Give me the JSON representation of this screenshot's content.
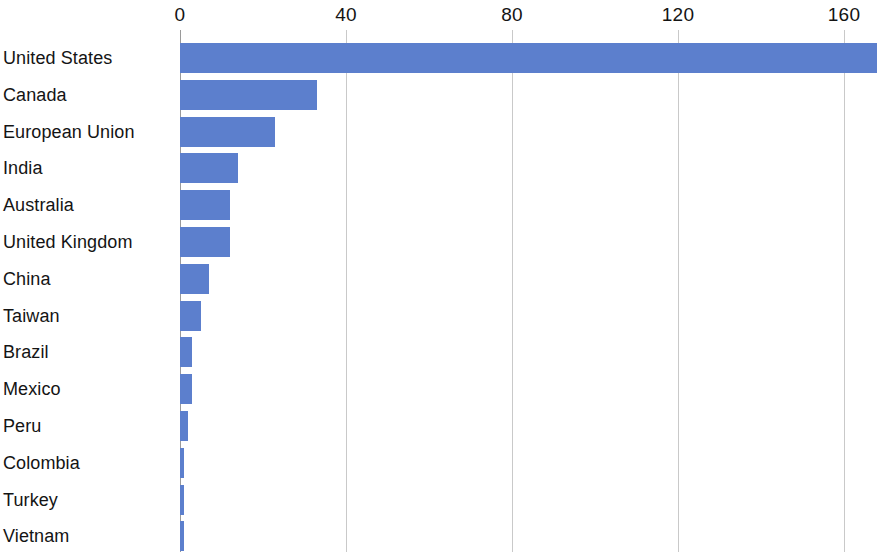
{
  "chart_data": {
    "type": "bar",
    "orientation": "horizontal",
    "title": "",
    "subtitle": "",
    "xlabel": "",
    "ylabel": "",
    "categories": [
      "United States",
      "Canada",
      "European Union",
      "India",
      "Australia",
      "United Kingdom",
      "China",
      "Taiwan",
      "Brazil",
      "Mexico",
      "Peru",
      "Colombia",
      "Turkey",
      "Vietnam"
    ],
    "values": [
      168,
      33,
      23,
      14,
      12,
      12,
      7,
      5,
      3,
      3,
      2,
      1,
      1,
      1
    ],
    "xlim": [
      0,
      170
    ],
    "xticks": [
      0,
      40,
      80,
      120,
      160
    ],
    "xtick_labels": [
      "0",
      "40",
      "80",
      "120",
      "160"
    ],
    "grid": true,
    "grid_axis": "x",
    "legend": false,
    "bar_color": "#5c7fcd",
    "gridline_color": "#c9c9c9",
    "axis_color": "#9a9a9a",
    "label_color": "#141414",
    "background_color": "#ffffff"
  }
}
